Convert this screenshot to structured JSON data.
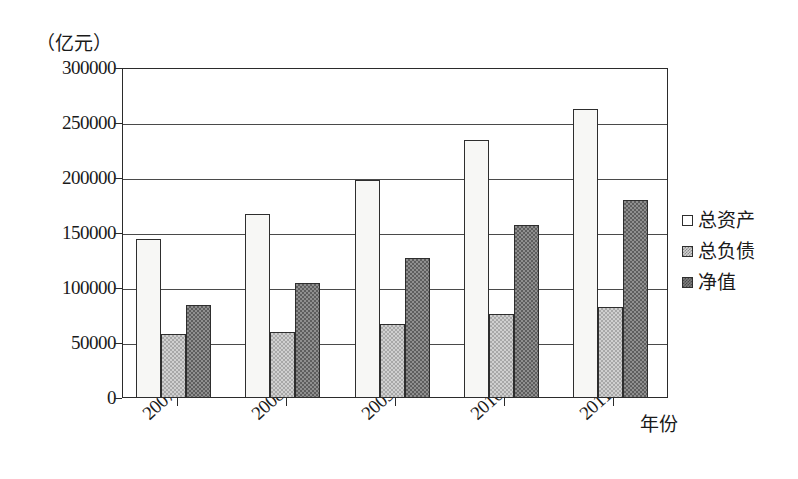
{
  "chart_data": {
    "type": "bar",
    "title": "",
    "subtitle": "",
    "xlabel": "年份",
    "ylabel": "（亿元）",
    "categories": [
      "2007",
      "2008",
      "2009",
      "2010",
      "2011"
    ],
    "series": [
      {
        "name": "总资产",
        "values": [
          145000,
          167000,
          198000,
          235000,
          263000
        ],
        "fill": "white"
      },
      {
        "name": "总负债",
        "values": [
          58000,
          60000,
          67000,
          76000,
          83000
        ],
        "fill": "light-checker"
      },
      {
        "name": "净值",
        "values": [
          85000,
          105000,
          127000,
          157000,
          180000
        ],
        "fill": "dark-checker"
      }
    ],
    "ylim": [
      0,
      300000
    ],
    "yticks": [
      0,
      50000,
      100000,
      150000,
      200000,
      250000,
      300000
    ],
    "ytick_labels": [
      "0",
      "50000",
      "100000",
      "150000",
      "200000",
      "250000",
      "300000"
    ],
    "xtick_labels": [
      "2007",
      "2008",
      "2009",
      "2010",
      "2011"
    ],
    "grid": "horizontal",
    "legend_position": "right",
    "legend_entries": [
      "总资产",
      "总负债",
      "净值"
    ],
    "colors": {
      "series_0": "#f7f7f5",
      "series_1": "#d0d0d0",
      "series_2": "#8f8f8f",
      "axis": "#2b2b2b",
      "grid": "#4a4a4a",
      "background": "#ffffff"
    }
  }
}
